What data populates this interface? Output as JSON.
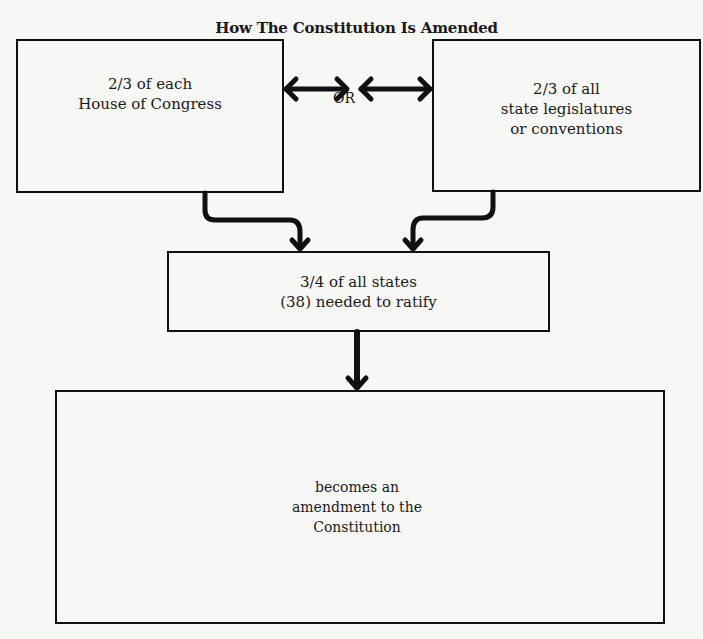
{
  "diagram": {
    "title": "How The Constitution Is Amended",
    "nodes": [
      {
        "id": "congress",
        "label": "2/3 of each\nHouse of Congress"
      },
      {
        "id": "states",
        "label": "2/3 of all\nstate legislatures\nor conventions"
      },
      {
        "id": "ratify",
        "label": "3/4 of all states\n(38) needed to ratify"
      },
      {
        "id": "amend",
        "label": "becomes an\namendment to the\nConstitution"
      }
    ],
    "connector_label": "OR",
    "edges": [
      {
        "from": "congress",
        "to": "states",
        "type": "bidirectional",
        "label": "OR"
      },
      {
        "from": "congress",
        "to": "ratify",
        "type": "arrow"
      },
      {
        "from": "states",
        "to": "ratify",
        "type": "arrow"
      },
      {
        "from": "ratify",
        "to": "amend",
        "type": "arrow"
      }
    ],
    "colors": {
      "background": "#f7f7f5",
      "ink": "#111111"
    }
  }
}
